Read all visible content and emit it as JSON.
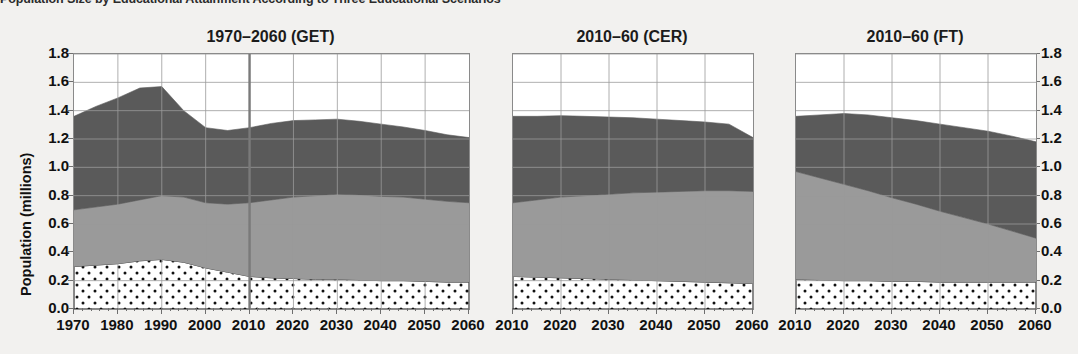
{
  "figure": {
    "suptitle": "Population Size by Educational Attainment According to Three Educational Scenarios",
    "ylabel": "Population (millions)",
    "colors": {
      "background": "#f2f1ef",
      "plot_background": "#ffffff",
      "grid": "#9a9a9a",
      "axis": "#8a8a8a",
      "low_education": "#ffffff",
      "medium_education": "#9a9a9a",
      "high_education": "#5a5a5a",
      "reference_line": "#7a7a7a",
      "text": "#111111"
    }
  },
  "chart_data": {
    "type": "area",
    "title": "Population Size by Educational Attainment According to Three Educational Scenarios",
    "ylabel": "Population (millions)",
    "xlabel": "",
    "ylim": [
      0.0,
      1.8
    ],
    "ytick_labels": [
      "0.0",
      "0.2",
      "0.4",
      "0.6",
      "0.8",
      "1.0",
      "1.2",
      "1.4",
      "1.6",
      "1.8"
    ],
    "ytick_values": [
      0.0,
      0.2,
      0.4,
      0.6,
      0.8,
      1.0,
      1.2,
      1.4,
      1.6,
      1.8
    ],
    "grid": true,
    "legend": "none",
    "stacked": true,
    "series_names": [
      "Low education",
      "Medium education",
      "High education"
    ],
    "panels": [
      {
        "title": "1970–2060 (GET)",
        "xlim": [
          1970,
          2060
        ],
        "xtick_labels": [
          "1970",
          "1980",
          "1990",
          "2000",
          "2010",
          "2020",
          "2030",
          "2040",
          "2050",
          "2060"
        ],
        "x": [
          1970,
          1975,
          1980,
          1985,
          1990,
          1995,
          2000,
          2005,
          2010,
          2015,
          2020,
          2025,
          2030,
          2035,
          2040,
          2045,
          2050,
          2055,
          2060
        ],
        "reference_line_x": 2010,
        "series": [
          {
            "name": "Low education",
            "values": [
              0.3,
              0.31,
              0.32,
              0.34,
              0.35,
              0.33,
              0.29,
              0.26,
              0.23,
              0.22,
              0.215,
              0.21,
              0.21,
              0.205,
              0.2,
              0.2,
              0.195,
              0.19,
              0.19
            ]
          },
          {
            "name": "Medium education",
            "values": [
              0.4,
              0.41,
              0.42,
              0.43,
              0.45,
              0.46,
              0.46,
              0.48,
              0.52,
              0.55,
              0.575,
              0.59,
              0.6,
              0.6,
              0.595,
              0.59,
              0.58,
              0.57,
              0.56
            ]
          },
          {
            "name": "High education",
            "values": [
              0.66,
              0.71,
              0.75,
              0.79,
              0.77,
              0.61,
              0.53,
              0.52,
              0.53,
              0.54,
              0.54,
              0.535,
              0.53,
              0.52,
              0.51,
              0.495,
              0.485,
              0.47,
              0.46
            ]
          }
        ],
        "totals": [
          1.36,
          1.43,
          1.49,
          1.56,
          1.57,
          1.4,
          1.28,
          1.26,
          1.28,
          1.31,
          1.33,
          1.335,
          1.34,
          1.325,
          1.305,
          1.285,
          1.26,
          1.23,
          1.21
        ]
      },
      {
        "title": "2010–60 (CER)",
        "xlim": [
          2010,
          2060
        ],
        "xtick_labels": [
          "2010",
          "2020",
          "2030",
          "2040",
          "2050",
          "2060"
        ],
        "x": [
          2010,
          2015,
          2020,
          2025,
          2030,
          2035,
          2040,
          2045,
          2050,
          2055,
          2060
        ],
        "reference_line_x": null,
        "series": [
          {
            "name": "Low education",
            "values": [
              0.23,
              0.225,
              0.22,
              0.215,
              0.21,
              0.205,
              0.2,
              0.195,
              0.19,
              0.185,
              0.18
            ]
          },
          {
            "name": "Medium education",
            "values": [
              0.52,
              0.545,
              0.57,
              0.585,
              0.6,
              0.615,
              0.625,
              0.635,
              0.645,
              0.65,
              0.65
            ]
          },
          {
            "name": "High education",
            "values": [
              0.61,
              0.59,
              0.575,
              0.56,
              0.545,
              0.53,
              0.515,
              0.5,
              0.485,
              0.47,
              0.38
            ]
          }
        ],
        "totals": [
          1.36,
          1.36,
          1.365,
          1.36,
          1.355,
          1.35,
          1.34,
          1.33,
          1.32,
          1.305,
          1.21
        ]
      },
      {
        "title": "2010–60 (FT)",
        "xlim": [
          2010,
          2060
        ],
        "xtick_labels": [
          "2010",
          "2020",
          "2030",
          "2040",
          "2050",
          "2060"
        ],
        "x": [
          2010,
          2015,
          2020,
          2025,
          2030,
          2035,
          2040,
          2045,
          2050,
          2055,
          2060
        ],
        "reference_line_x": null,
        "series": [
          {
            "name": "Low education",
            "values": [
              0.21,
              0.205,
              0.2,
              0.2,
              0.195,
              0.195,
              0.19,
              0.19,
              0.19,
              0.19,
              0.19
            ]
          },
          {
            "name": "Medium education",
            "values": [
              0.76,
              0.72,
              0.68,
              0.635,
              0.59,
              0.545,
              0.5,
              0.455,
              0.41,
              0.36,
              0.31
            ]
          },
          {
            "name": "High education",
            "values": [
              0.39,
              0.445,
              0.5,
              0.535,
              0.565,
              0.59,
              0.615,
              0.635,
              0.655,
              0.67,
              0.68
            ]
          }
        ],
        "totals": [
          1.36,
          1.37,
          1.38,
          1.37,
          1.35,
          1.33,
          1.305,
          1.28,
          1.255,
          1.22,
          1.18
        ]
      }
    ]
  }
}
